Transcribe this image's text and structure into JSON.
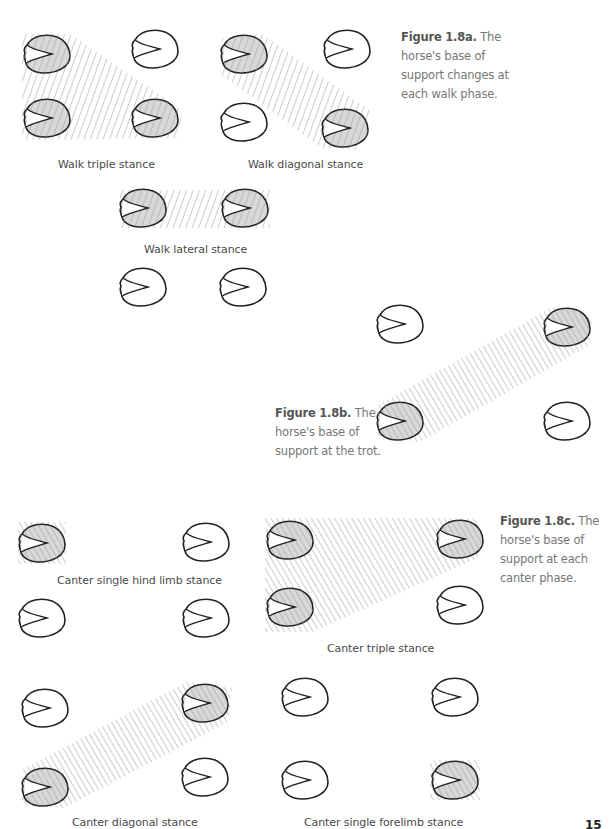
{
  "figures": [
    {
      "id": "1.8a",
      "caption_title": "Figure 1.8a.",
      "caption_text": "The horse's base of support changes at each walk phase.",
      "panels": [
        {
          "label": "Walk triple stance",
          "hooves": [
            {
              "x": 47,
              "y": 54,
              "shaded": true
            },
            {
              "x": 155,
              "y": 49,
              "shaded": false
            },
            {
              "x": 47,
              "y": 118,
              "shaded": true
            },
            {
              "x": 155,
              "y": 118,
              "shaded": true
            }
          ],
          "support_polygon": [
            [
              22,
              34
            ],
            [
              70,
              34
            ],
            [
              182,
              110
            ],
            [
              180,
              138
            ],
            [
              22,
              140
            ]
          ]
        },
        {
          "label": "Walk diagonal stance",
          "hooves": [
            {
              "x": 244,
              "y": 54,
              "shaded": true
            },
            {
              "x": 347,
              "y": 49,
              "shaded": false
            },
            {
              "x": 244,
              "y": 122,
              "shaded": false
            },
            {
              "x": 345,
              "y": 128,
              "shaded": true
            }
          ],
          "support_polygon": [
            [
              222,
              38
            ],
            [
              262,
              34
            ],
            [
              372,
              112
            ],
            [
              360,
              150
            ],
            [
              322,
              148
            ],
            [
              220,
              74
            ]
          ]
        },
        {
          "label": "Walk lateral stance",
          "hooves": [
            {
              "x": 143,
              "y": 208,
              "shaded": true
            },
            {
              "x": 245,
              "y": 208,
              "shaded": true
            },
            {
              "x": 143,
              "y": 287,
              "shaded": false
            },
            {
              "x": 243,
              "y": 287,
              "shaded": false
            }
          ],
          "support_polygon": [
            [
              120,
              190
            ],
            [
              270,
              190
            ],
            [
              270,
              228
            ],
            [
              120,
              228
            ]
          ]
        }
      ]
    },
    {
      "id": "1.8b",
      "caption_title": "Figure 1.8b.",
      "caption_text": "The horse's base of support at the trot.",
      "panels": [
        {
          "label": "",
          "hooves": [
            {
              "x": 400,
              "y": 324,
              "shaded": false
            },
            {
              "x": 567,
              "y": 327,
              "shaded": true
            },
            {
              "x": 400,
              "y": 421,
              "shaded": true
            },
            {
              "x": 567,
              "y": 421,
              "shaded": false
            }
          ],
          "support_polygon": [
            [
              378,
              405
            ],
            [
              552,
              307
            ],
            [
              592,
              318
            ],
            [
              590,
              345
            ],
            [
              420,
              442
            ],
            [
              378,
              436
            ]
          ]
        }
      ]
    },
    {
      "id": "1.8c",
      "caption_title": "Figure 1.8c.",
      "caption_text": "The horse's base of support at each canter phase.",
      "panels": [
        {
          "label": "Canter single hind limb stance",
          "hooves": [
            {
              "x": 42,
              "y": 543,
              "shaded": true
            },
            {
              "x": 206,
              "y": 542,
              "shaded": false
            },
            {
              "x": 42,
              "y": 618,
              "shaded": false
            },
            {
              "x": 206,
              "y": 618,
              "shaded": false
            }
          ],
          "support_polygon": [
            [
              18,
              522
            ],
            [
              66,
              522
            ],
            [
              66,
              564
            ],
            [
              18,
              564
            ]
          ]
        },
        {
          "label": "Canter triple stance",
          "hooves": [
            {
              "x": 290,
              "y": 540,
              "shaded": true
            },
            {
              "x": 460,
              "y": 539,
              "shaded": true
            },
            {
              "x": 290,
              "y": 607,
              "shaded": true
            },
            {
              "x": 460,
              "y": 605,
              "shaded": false
            }
          ],
          "support_polygon": [
            [
              265,
              518
            ],
            [
              478,
              518
            ],
            [
              478,
              558
            ],
            [
              312,
              632
            ],
            [
              265,
              632
            ]
          ]
        },
        {
          "label": "Canter diagonal stance",
          "hooves": [
            {
              "x": 45,
              "y": 708,
              "shaded": false
            },
            {
              "x": 205,
              "y": 703,
              "shaded": true
            },
            {
              "x": 45,
              "y": 787,
              "shaded": true
            },
            {
              "x": 205,
              "y": 777,
              "shaded": false
            }
          ],
          "support_polygon": [
            [
              22,
              770
            ],
            [
              186,
              682
            ],
            [
              232,
              688
            ],
            [
              228,
              722
            ],
            [
              64,
              808
            ],
            [
              22,
              806
            ]
          ]
        },
        {
          "label": "Canter single forelimb stance",
          "hooves": [
            {
              "x": 305,
              "y": 697,
              "shaded": false
            },
            {
              "x": 455,
              "y": 697,
              "shaded": false
            },
            {
              "x": 305,
              "y": 780,
              "shaded": false
            },
            {
              "x": 455,
              "y": 780,
              "shaded": true
            }
          ],
          "support_polygon": [
            [
              430,
              760
            ],
            [
              480,
              760
            ],
            [
              480,
              800
            ],
            [
              430,
              800
            ]
          ]
        }
      ]
    }
  ],
  "labels": {
    "walk_triple": "Walk triple stance",
    "walk_diagonal": "Walk diagonal stance",
    "walk_lateral": "Walk lateral stance",
    "canter_single_hind": "Canter single hind limb stance",
    "canter_triple": "Canter triple stance",
    "canter_diagonal": "Canter diagonal stance",
    "canter_single_fore": "Canter single forelimb stance"
  },
  "captions": {
    "a_title": "Figure 1.8a.",
    "a_text": " The horse's base of support changes at each walk phase.",
    "b_title": "Figure 1.8b.",
    "b_text": " The horse's base of support at the trot.",
    "c_title": "Figure 1.8c.",
    "c_text": " The horse's base of support at each canter phase."
  },
  "page_number": "15",
  "colors": {
    "outline": "#222222",
    "hatch": "#9a9a9a",
    "hoof_fill_shaded": "#d8d8d8",
    "hoof_fill_plain": "#ffffff"
  }
}
